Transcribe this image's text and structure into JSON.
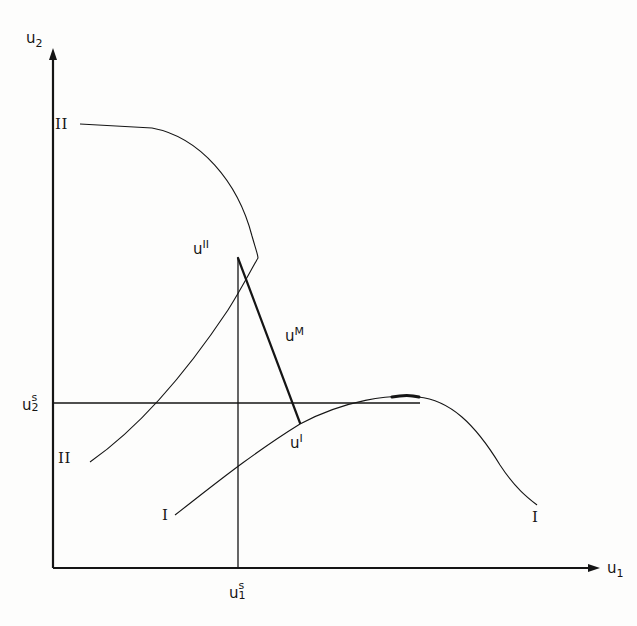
{
  "figure": {
    "type": "diagram",
    "background_color": "#fdfdfc",
    "ink_color": "#151515",
    "width": 637,
    "height": 626
  },
  "axes": {
    "x": {
      "label_base": "u",
      "label_sub": "1",
      "label_x": 607,
      "label_y": 560,
      "origin_x": 53,
      "origin_y": 568,
      "end_x": 598,
      "arrow": true
    },
    "y": {
      "label_base": "u",
      "label_sub": "2",
      "label_x": 26,
      "label_y": 30,
      "origin_x": 53,
      "origin_y": 568,
      "end_y": 52,
      "arrow": true
    }
  },
  "status_quo": {
    "x_label_base": "u",
    "x_label_sup": "s",
    "x_label_sub": "1",
    "x_label_x": 229,
    "x_label_y": 583,
    "x_value_px": 238,
    "y_label_base": "u",
    "y_label_sup": "s",
    "y_label_sub": "2",
    "y_label_x": 22,
    "y_label_y": 395,
    "y_value_px": 403,
    "vline_top": 258,
    "hline_right": 420
  },
  "points": [
    {
      "name": "u-II-point",
      "base": "u",
      "sup": "II",
      "x_px": 238,
      "y_px": 258,
      "label_x": 193,
      "label_y": 241
    },
    {
      "name": "u-M-point",
      "base": "u",
      "sup": "M",
      "x_px": 300,
      "y_px": 423,
      "label_x": 285,
      "label_y": 328
    },
    {
      "name": "u-I-point",
      "base": "u",
      "sup": "I",
      "x_px": 300,
      "y_px": 423,
      "label_x": 290,
      "label_y": 435
    }
  ],
  "curve_labels": [
    {
      "name": "curve-II-upper-label",
      "text": "II",
      "x": 55,
      "y": 117
    },
    {
      "name": "curve-II-lower-label",
      "text": "II",
      "x": 58,
      "y": 451
    },
    {
      "name": "curve-I-lower-label",
      "text": "I",
      "x": 162,
      "y": 508
    },
    {
      "name": "curve-I-right-label",
      "text": "I",
      "x": 532,
      "y": 510
    }
  ],
  "chart_data": {
    "type": "line",
    "title": "",
    "xlabel": "u1",
    "ylabel": "u2",
    "grid": false,
    "legend": "inline curve labels",
    "curves": [
      {
        "name": "frontier-II",
        "label": "II",
        "stroke_width": 1.1,
        "path": "M 80,124 L 152,128 C 200,137 238,182 252,236 C 256,250 258,255 258,258 C 252,268 242,288 228,310 C 200,352 150,420 90,462"
      },
      {
        "name": "frontier-I",
        "label": "I",
        "stroke_width": 1.1,
        "path": "M 175,515 C 210,488 250,455 300,424 C 345,400 390,394 418,397 C 450,400 475,424 500,465 C 515,488 528,498 537,505"
      }
    ],
    "segments": [
      {
        "name": "bargaining-set-edge-u2s-to-uII",
        "from": [
          238,
          403
        ],
        "to": [
          238,
          258
        ],
        "stroke_width": 1.3
      },
      {
        "name": "threat-line-uM",
        "from": [
          238,
          258
        ],
        "to": [
          300,
          423
        ],
        "stroke_width": 2.2
      },
      {
        "name": "status-quo-hline",
        "from": [
          53,
          403
        ],
        "to": [
          420,
          403
        ],
        "stroke_width": 1.3
      },
      {
        "name": "status-quo-vline",
        "from": [
          238,
          568
        ],
        "to": [
          238,
          403
        ],
        "stroke_width": 1.3
      }
    ]
  }
}
